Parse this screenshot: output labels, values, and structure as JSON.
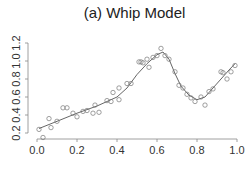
{
  "chart_data": {
    "type": "scatter",
    "title": "(a) Whip Model",
    "xlabel": "",
    "ylabel": "",
    "xlim": [
      0.0,
      1.0
    ],
    "ylim": [
      0.15,
      1.25
    ],
    "xticks": [
      "0.0",
      "0.2",
      "0.4",
      "0.6",
      "0.8",
      "1.0"
    ],
    "yticks": [
      "0.2",
      "0.4",
      "0.6",
      "0.8",
      "1.0",
      "1.2"
    ],
    "grid": false,
    "legend": null,
    "series": [
      {
        "name": "observations",
        "kind": "scatter",
        "marker": "open-circle",
        "color": "#777777",
        "points": [
          [
            0.01,
            0.24
          ],
          [
            0.03,
            0.15
          ],
          [
            0.06,
            0.36
          ],
          [
            0.07,
            0.26
          ],
          [
            0.1,
            0.33
          ],
          [
            0.13,
            0.48
          ],
          [
            0.15,
            0.48
          ],
          [
            0.18,
            0.42
          ],
          [
            0.2,
            0.38
          ],
          [
            0.23,
            0.44
          ],
          [
            0.25,
            0.45
          ],
          [
            0.28,
            0.42
          ],
          [
            0.29,
            0.51
          ],
          [
            0.31,
            0.43
          ],
          [
            0.35,
            0.56
          ],
          [
            0.37,
            0.55
          ],
          [
            0.38,
            0.65
          ],
          [
            0.41,
            0.7
          ],
          [
            0.41,
            0.57
          ],
          [
            0.45,
            0.75
          ],
          [
            0.47,
            0.75
          ],
          [
            0.51,
            0.99
          ],
          [
            0.52,
            0.99
          ],
          [
            0.53,
            0.98
          ],
          [
            0.55,
            1.02
          ],
          [
            0.56,
            0.93
          ],
          [
            0.58,
            1.04
          ],
          [
            0.6,
            1.06
          ],
          [
            0.62,
            1.14
          ],
          [
            0.64,
            1.06
          ],
          [
            0.66,
            1.02
          ],
          [
            0.69,
            0.88
          ],
          [
            0.71,
            0.73
          ],
          [
            0.73,
            0.7
          ],
          [
            0.75,
            0.63
          ],
          [
            0.77,
            0.59
          ],
          [
            0.79,
            0.55
          ],
          [
            0.82,
            0.6
          ],
          [
            0.84,
            0.51
          ],
          [
            0.86,
            0.66
          ],
          [
            0.88,
            0.69
          ],
          [
            0.92,
            0.88
          ],
          [
            0.93,
            0.87
          ],
          [
            0.95,
            0.8
          ],
          [
            0.97,
            0.88
          ],
          [
            0.99,
            0.95
          ]
        ]
      },
      {
        "name": "fitted curve",
        "kind": "line",
        "color": "#555555",
        "points": [
          [
            0.01,
            0.25
          ],
          [
            0.1,
            0.33
          ],
          [
            0.2,
            0.42
          ],
          [
            0.3,
            0.5
          ],
          [
            0.4,
            0.6
          ],
          [
            0.45,
            0.7
          ],
          [
            0.5,
            0.85
          ],
          [
            0.55,
            0.97
          ],
          [
            0.6,
            1.07
          ],
          [
            0.63,
            1.1
          ],
          [
            0.66,
            1.02
          ],
          [
            0.69,
            0.86
          ],
          [
            0.72,
            0.72
          ],
          [
            0.76,
            0.62
          ],
          [
            0.8,
            0.57
          ],
          [
            0.84,
            0.6
          ],
          [
            0.88,
            0.7
          ],
          [
            0.92,
            0.8
          ],
          [
            0.96,
            0.9
          ],
          [
            0.99,
            0.97
          ]
        ]
      }
    ]
  }
}
